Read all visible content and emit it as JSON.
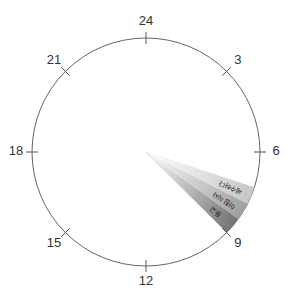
{
  "diagram": {
    "hours_per_turn": 24,
    "hour_labels": [
      {
        "hour": 24,
        "text": "24"
      },
      {
        "hour": 3,
        "text": "3"
      },
      {
        "hour": 6,
        "text": "6"
      },
      {
        "hour": 9,
        "text": "9"
      },
      {
        "hour": 12,
        "text": "12"
      },
      {
        "hour": 15,
        "text": "15"
      },
      {
        "hour": 18,
        "text": "18"
      },
      {
        "hour": 21,
        "text": "21"
      }
    ],
    "activities": [
      {
        "label": "세수하다",
        "start_hour": 7.2,
        "end_hour": 7.8,
        "color": "#c4c4c4"
      },
      {
        "label": "아침식사",
        "start_hour": 7.8,
        "end_hour": 8.4,
        "color": "#9a9a9a"
      },
      {
        "label": "등교",
        "start_hour": 8.4,
        "end_hour": 9.0,
        "color": "#6a6a6a"
      }
    ],
    "colors": {
      "dial": "#666666",
      "tick": "#555555",
      "text": "#333333"
    }
  }
}
